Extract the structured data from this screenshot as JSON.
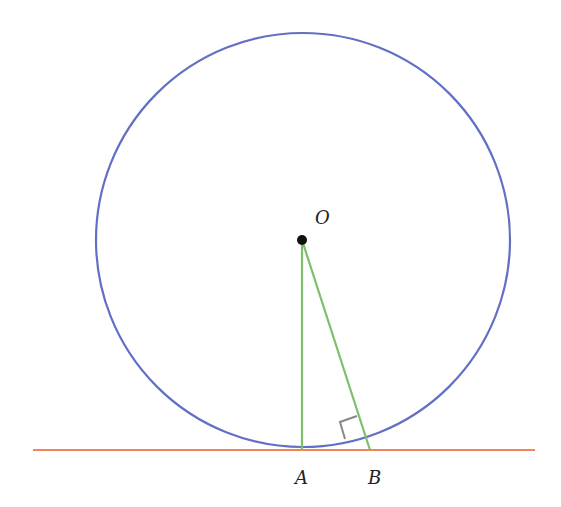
{
  "diagram": {
    "colors": {
      "circle": "#6270c4",
      "tangent_line": "#f0845c",
      "segments": "#7cc06a",
      "right_angle": "#888888",
      "point": "#111111"
    },
    "circle": {
      "cx": 303,
      "cy": 240,
      "r": 207
    },
    "tangent_line": {
      "x1": 33,
      "y1": 450,
      "x2": 535,
      "y2": 450
    },
    "points": {
      "O": {
        "label": "O",
        "x": 302,
        "y": 240
      },
      "A": {
        "label": "A",
        "x": 302,
        "y": 450
      },
      "B": {
        "label": "B",
        "x": 370,
        "y": 450
      }
    },
    "labels": {
      "O": "O",
      "A": "A",
      "B": "B"
    }
  }
}
